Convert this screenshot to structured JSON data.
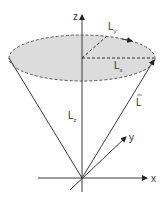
{
  "diagram": {
    "axes": {
      "z_label": "z",
      "x_label": "x",
      "y_label": "y"
    },
    "vectors": {
      "L_label": "L",
      "Lz_label": "L",
      "Lz_sub": "z",
      "Lx_label": "L",
      "Lx_sub": "x",
      "Ly_label": "L",
      "Ly_sub": "y"
    },
    "colors": {
      "line": "#3a3a3a",
      "ellipse_fill": "#dcdcdc",
      "dash": "#444444"
    }
  }
}
